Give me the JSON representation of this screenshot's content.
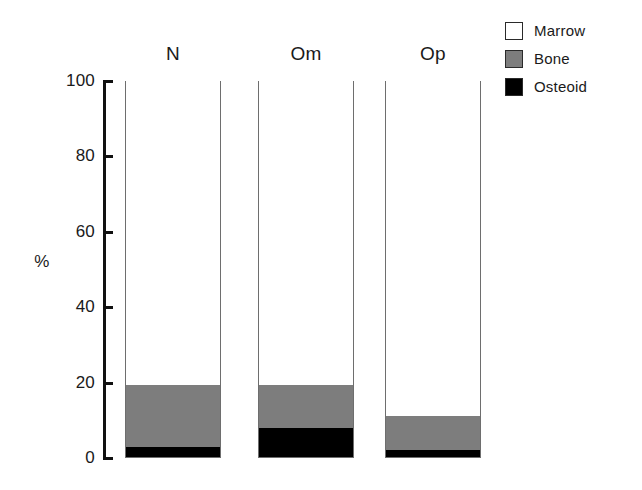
{
  "chart_data": {
    "type": "bar",
    "subtype": "stacked-percentage",
    "title": "",
    "xlabel": "",
    "ylabel": "%",
    "ylim": [
      0,
      100
    ],
    "yticks": [
      0,
      20,
      40,
      60,
      80,
      100
    ],
    "ytick_labels": [
      "0",
      "20",
      "40",
      "60",
      "80",
      "100"
    ],
    "grid": false,
    "legend_position": "top-right",
    "categories": [
      "N",
      "Om",
      "Op"
    ],
    "series": [
      {
        "name": "Marrow",
        "color": "#ffffff",
        "values": [
          80.9,
          80.9,
          89.1
        ]
      },
      {
        "name": "Bone",
        "color": "#7d7d7d",
        "values": [
          16.4,
          11.4,
          9.0
        ]
      },
      {
        "name": "Osteoid",
        "color": "#000000",
        "values": [
          2.7,
          7.7,
          1.9
        ]
      }
    ]
  },
  "axis": {
    "y_label": "%",
    "ticks": [
      {
        "value": 100,
        "label": "100"
      },
      {
        "value": 80,
        "label": "80"
      },
      {
        "value": 60,
        "label": "60"
      },
      {
        "value": 40,
        "label": "40"
      },
      {
        "value": 20,
        "label": "20"
      },
      {
        "value": 0,
        "label": "0"
      }
    ]
  },
  "bars": [
    {
      "label": "N",
      "marrow": 80.9,
      "bone": 16.4,
      "osteoid": 2.7
    },
    {
      "label": "Om",
      "marrow": 80.9,
      "bone": 11.4,
      "osteoid": 7.7
    },
    {
      "label": "Op",
      "marrow": 89.1,
      "bone": 9.0,
      "osteoid": 1.9
    }
  ],
  "legend": {
    "items": [
      {
        "label": "Marrow",
        "color": "#ffffff"
      },
      {
        "label": "Bone",
        "color": "#7d7d7d"
      },
      {
        "label": "Osteoid",
        "color": "#000000"
      }
    ]
  },
  "colors": {
    "marrow": "#ffffff",
    "bone": "#7d7d7d",
    "osteoid": "#000000",
    "axis": "#111111",
    "bar_outline": "#6e6e6e",
    "background": "#ffffff"
  }
}
